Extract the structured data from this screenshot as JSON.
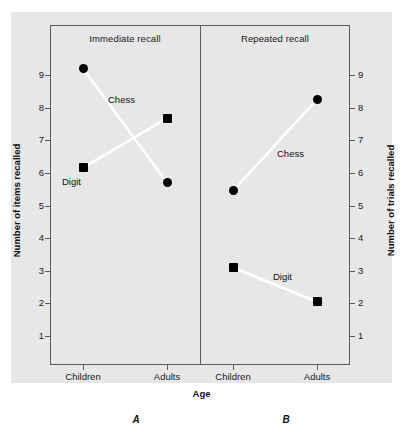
{
  "figure": {
    "x_axis_title": "Age",
    "panels": [
      {
        "letter": "A",
        "title": "Immediate recall",
        "axis_title": "Number of items recalled",
        "categories": [
          "Children",
          "Adults"
        ]
      },
      {
        "letter": "B",
        "title": "Repeated recall",
        "axis_title": "Number of trials recalled",
        "categories": [
          "Children",
          "Adults"
        ]
      }
    ],
    "series_labels": {
      "chess_a": "Chess",
      "digit_a": "Digit",
      "chess_b": "Chess",
      "digit_b": "Digit"
    },
    "y_ticks": [
      "9",
      "8",
      "7",
      "6",
      "5",
      "4",
      "3",
      "2",
      "1"
    ],
    "colors": {
      "plate_background": "#e7e7e7",
      "frame": "#5c5c5c",
      "marker": "#000000",
      "connector_line": "#ffffff",
      "text": "#111111"
    }
  },
  "chart_data": {
    "type": "line",
    "title": "",
    "subtitle": "",
    "xlabel": "Age",
    "grid": false,
    "legend_position": "inline-annotations",
    "panels": [
      {
        "panel": "A",
        "title": "Immediate recall",
        "ylabel": "Number of items recalled",
        "ylim": [
          0,
          10
        ],
        "yticks": [
          1,
          2,
          3,
          4,
          5,
          6,
          7,
          8,
          9
        ],
        "categories": [
          "Children",
          "Adults"
        ],
        "series": [
          {
            "name": "Chess",
            "marker": "circle",
            "values": [
              9.2,
              5.7
            ]
          },
          {
            "name": "Digit",
            "marker": "square",
            "values": [
              6.15,
              7.68
            ]
          }
        ]
      },
      {
        "panel": "B",
        "title": "Repeated recall",
        "ylabel": "Number of trials recalled",
        "ylim": [
          0,
          10
        ],
        "yticks": [
          1,
          2,
          3,
          4,
          5,
          6,
          7,
          8,
          9
        ],
        "categories": [
          "Children",
          "Adults"
        ],
        "series": [
          {
            "name": "Chess",
            "marker": "circle",
            "values": [
              5.45,
              8.25
            ]
          },
          {
            "name": "Digit",
            "marker": "square",
            "values": [
              3.1,
              2.05
            ]
          }
        ]
      }
    ]
  }
}
